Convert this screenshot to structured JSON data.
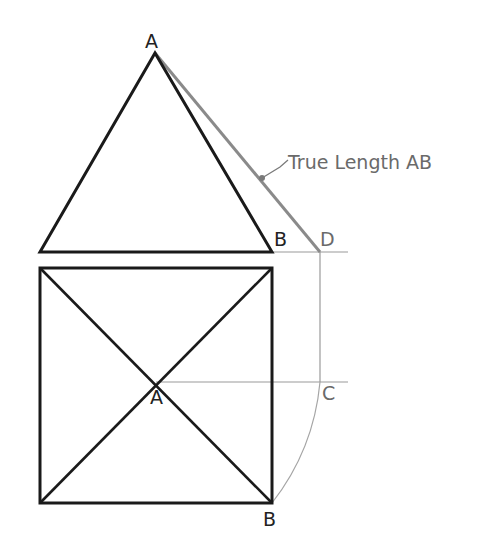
{
  "diagram": {
    "colors": {
      "object_line": "#1a1a1a",
      "construction_line": "#9a9a9a",
      "true_length_line": "#8a8a8a",
      "label_dark": "#222222",
      "label_grey": "#6a6a6a"
    },
    "elevation": {
      "apex_label": "A",
      "base_right_label": "B",
      "rotated_point_label": "D"
    },
    "plan": {
      "center_label": "A",
      "corner_label": "B",
      "rotated_point_label": "C"
    },
    "annotation": {
      "text": "True Length AB"
    }
  }
}
